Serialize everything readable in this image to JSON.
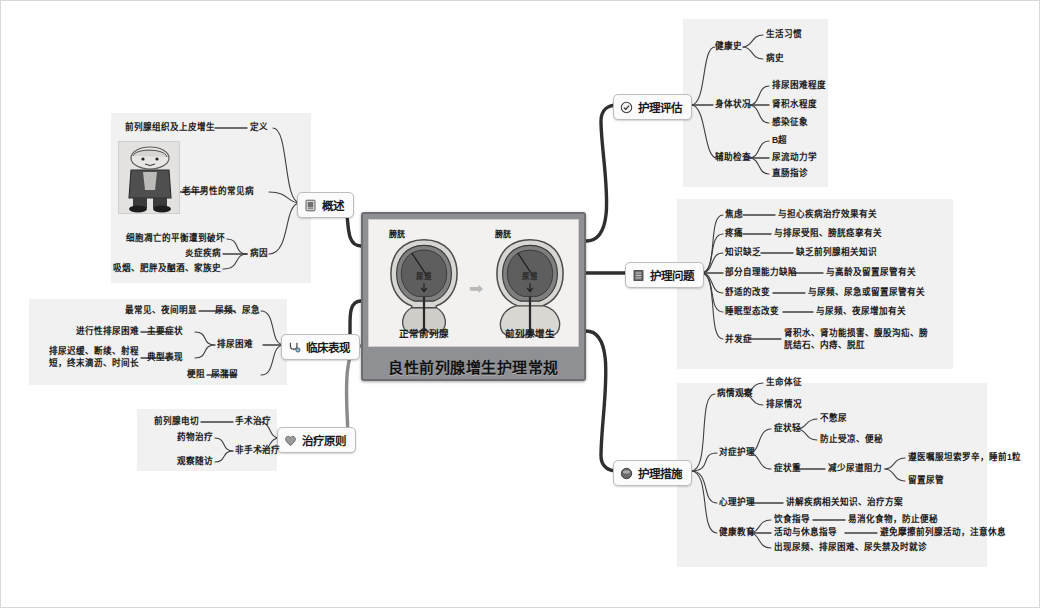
{
  "root": {
    "title": "良性前列腺增生护理常规",
    "illustration": {
      "left_caption": "正常前列腺",
      "right_caption": "前列腺增生",
      "left_label": "膀胱",
      "right_label": "膀胱",
      "left_inner_label": "尿道",
      "right_inner_label": "尿道",
      "arrow": "➡"
    }
  },
  "colors": {
    "root_frame": "#6d6e71",
    "root_fill": "#8f9093",
    "panel": "#eeeeee",
    "wire": "#4a4a4a",
    "node_border": "#bdbdbd",
    "node_fill": "#fbfbfb"
  },
  "branches": [
    {
      "id": "gaishu",
      "label": "概述",
      "icon": "book-icon",
      "children": [
        {
          "label": "定义",
          "details": [
            "前列腺组织及上皮增生"
          ]
        },
        {
          "label": "老年男性的常见病",
          "details": []
        },
        {
          "label": "病因",
          "details": [
            "细胞凋亡的平衡遭到破坏",
            "炎症疾病",
            "吸烟、肥胖及酗酒、家族史"
          ]
        }
      ]
    },
    {
      "id": "linchuang",
      "label": "临床表现",
      "icon": "stethoscope-icon",
      "children": [
        {
          "label": "尿频、尿急",
          "details": [
            "最常见、夜间明显"
          ]
        },
        {
          "label": "排尿困难",
          "details": [],
          "sub": [
            {
              "label": "主要症状",
              "details": [
                "进行性排尿困难"
              ]
            },
            {
              "label": "典型表现",
              "details": [
                "排尿迟缓、断续、射程短，",
                "终末滴沥、时间长"
              ]
            }
          ]
        },
        {
          "label": "尿潴留",
          "details": [
            "梗阻"
          ]
        }
      ]
    },
    {
      "id": "zhiliao",
      "label": "治疗原则",
      "icon": "heart-icon",
      "children": [
        {
          "label": "手术治疗",
          "details": [
            "前列腺电切"
          ]
        },
        {
          "label": "非手术治疗",
          "details": [
            "药物治疗",
            "观察随访"
          ]
        }
      ]
    },
    {
      "id": "pinggu",
      "label": "护理评估",
      "icon": "check-circle-icon",
      "children": [
        {
          "label": "健康史",
          "details": [
            "生活习惯",
            "病史"
          ]
        },
        {
          "label": "身体状况",
          "details": [
            "排尿困难程度",
            "肾积水程度",
            "感染征象"
          ]
        },
        {
          "label": "辅助检查",
          "details": [
            "B超",
            "尿流动力学",
            "直肠指诊"
          ]
        }
      ]
    },
    {
      "id": "wenti",
      "label": "护理问题",
      "icon": "list-icon",
      "children": [
        {
          "label": "焦虑",
          "detail": "与担心疾病治疗效果有关"
        },
        {
          "label": "疼痛",
          "detail": "与排尿受阻、膀胱痉挛有关"
        },
        {
          "label": "知识缺乏",
          "detail": "缺乏前列腺相关知识"
        },
        {
          "label": "部分自理能力缺陷",
          "detail": "与高龄及留置尿管有关"
        },
        {
          "label": "舒适的改变",
          "detail": "与尿频、尿急或留置尿管有关"
        },
        {
          "label": "睡眠型态改变",
          "detail": "与尿频、夜尿增加有关"
        },
        {
          "label": "并发症",
          "detail": "肾积水、肾功能损害、腹股沟疝、膀胱结石、内痔、脱肛"
        }
      ]
    },
    {
      "id": "cuoshi",
      "label": "护理措施",
      "icon": "pill-icon",
      "children": [
        {
          "label": "病情观察",
          "details": [
            "生命体征",
            "排尿情况"
          ]
        },
        {
          "label": "对症护理",
          "sub": [
            {
              "label": "症状轻",
              "details": [
                "不憋尿",
                "防止受凉、便秘"
              ]
            },
            {
              "label": "症状重",
              "detail": "减少尿道阻力",
              "details2": [
                "遵医嘱服坦索罗辛，睡前1粒",
                "留置尿管"
              ]
            }
          ]
        },
        {
          "label": "心理护理",
          "detail": "讲解疾病相关知识、治疗方案"
        },
        {
          "label": "健康教育",
          "details": [
            "饮食指导",
            "活动与休息指导",
            "出现尿频、排尿困难、尿失禁及时就诊"
          ],
          "detail_of": [
            "易消化食物，防止便秘",
            "避免摩擦前列腺活动，注意休息",
            ""
          ]
        }
      ]
    }
  ],
  "text": {
    "gaishu_def_detail": "前列腺组织及上皮增生",
    "gaishu_def": "定义",
    "gaishu_common": "老年男性的常见病",
    "gaishu_cause": "病因",
    "gaishu_c1": "细胞凋亡的平衡遭到破坏",
    "gaishu_c2": "炎症疾病",
    "gaishu_c3": "吸烟、肥胖及酗酒、家族史",
    "lc_freq_detail": "最常见、夜间明显",
    "lc_freq": "尿频、尿急",
    "lc_diff": "排尿困难",
    "lc_main_detail": "进行性排尿困难",
    "lc_main": "主要症状",
    "lc_typ": "典型表现",
    "lc_typ_detail": "排尿迟缓、断续、射程短，终末滴沥、时间长",
    "lc_ret_detail": "梗阻",
    "lc_ret": "尿潴留",
    "zl_surg_detail": "前列腺电切",
    "zl_surg": "手术治疗",
    "zl_drug": "药物治疗",
    "zl_follow": "观察随访",
    "zl_nonsurg": "非手术治疗",
    "pg_hist": "健康史",
    "pg_h1": "生活习惯",
    "pg_h2": "病史",
    "pg_body": "身体状况",
    "pg_b1": "排尿困难程度",
    "pg_b2": "肾积水程度",
    "pg_b3": "感染征象",
    "pg_aux": "辅助检查",
    "pg_a1": "B超",
    "pg_a2": "尿流动力学",
    "pg_a3": "直肠指诊",
    "wt_1": "焦虑",
    "wt_1d": "与担心疾病治疗效果有关",
    "wt_2": "疼痛",
    "wt_2d": "与排尿受阻、膀胱痉挛有关",
    "wt_3": "知识缺乏",
    "wt_3d": "缺乏前列腺相关知识",
    "wt_4": "部分自理能力缺陷",
    "wt_4d": "与高龄及留置尿管有关",
    "wt_5": "舒适的改变",
    "wt_5d": "与尿频、尿急或留置尿管有关",
    "wt_6": "睡眠型态改变",
    "wt_6d": "与尿频、夜尿增加有关",
    "wt_7": "并发症",
    "wt_7d": "肾积水、肾功能损害、腹股沟疝、膀胱结石、内痔、脱肛",
    "cs_obs": "病情观察",
    "cs_o1": "生命体征",
    "cs_o2": "排尿情况",
    "cs_sym": "对症护理",
    "cs_light": "症状轻",
    "cs_l1": "不憋尿",
    "cs_l2": "防止受凉、便秘",
    "cs_heavy": "症状重",
    "cs_h0": "减少尿道阻力",
    "cs_h1": "遵医嘱服坦索罗辛，睡前1粒",
    "cs_h2": "留置尿管",
    "cs_psy": "心理护理",
    "cs_psy_d": "讲解疾病相关知识、治疗方案",
    "cs_edu": "健康教育",
    "cs_e1": "饮食指导",
    "cs_e1d": "易消化食物，防止便秘",
    "cs_e2": "活动与休息指导",
    "cs_e2d": "避免摩擦前列腺活动，注意休息",
    "cs_e3": "出现尿频、排尿困难、尿失禁及时就诊"
  }
}
